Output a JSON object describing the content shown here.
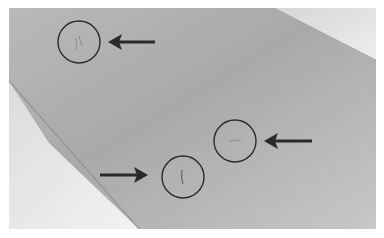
{
  "image": {
    "description": "Grayscale photograph of a surface with three circled markings indicated by arrows",
    "frame": {
      "x": 9,
      "y": 8,
      "width": 367,
      "height": 221
    },
    "colors": {
      "surface_dark": "#a8a8a8",
      "surface_mid": "#bdbdbd",
      "surface_light": "#d4d4d4",
      "paper_white": "#ececec",
      "annotation": "#2a2a2a"
    }
  },
  "annotations": {
    "circles": [
      {
        "cx": 70,
        "cy": 34,
        "r": 21
      },
      {
        "cx": 174,
        "cy": 169,
        "r": 21
      },
      {
        "cx": 226,
        "cy": 133,
        "r": 21
      }
    ],
    "arrows": [
      {
        "direction": "left",
        "x1": 146,
        "y1": 34,
        "x2": 99,
        "y2": 34
      },
      {
        "direction": "right",
        "x1": 91,
        "y1": 167,
        "x2": 139,
        "y2": 167
      },
      {
        "direction": "left",
        "x1": 303,
        "y1": 133,
        "x2": 255,
        "y2": 133
      }
    ]
  }
}
